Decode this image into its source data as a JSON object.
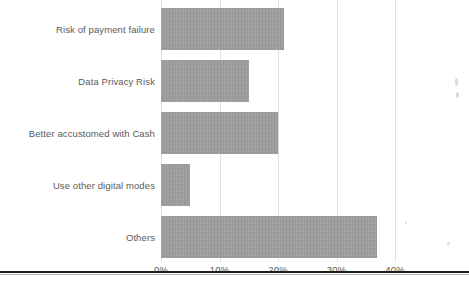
{
  "chart_data": {
    "type": "bar",
    "orientation": "horizontal",
    "title": "",
    "subtitle": "",
    "xlabel": "",
    "ylabel": "",
    "categories": [
      "Risk of payment failure",
      "Data Privacy Risk",
      "Better accustomed with Cash",
      "Use other digital modes",
      "Others"
    ],
    "values": [
      21,
      15,
      20,
      5,
      37
    ],
    "value_unit": "%",
    "series": [
      {
        "name": "Share of respondents",
        "values": [
          21,
          15,
          20,
          5,
          37
        ],
        "color": "#9a9a9a"
      }
    ],
    "xlim": [
      0,
      40
    ],
    "xticks": [
      0,
      10,
      20,
      30,
      40
    ],
    "xtick_labels": [
      "0%",
      "10%",
      "20%",
      "30%",
      "40%"
    ],
    "grid": true,
    "grid_axis": "x",
    "legend": false,
    "legend_position": "none",
    "annotations": []
  },
  "style": {
    "bar_color": "#9a9a9a",
    "grid_color": "#e2e2e2",
    "text_color": "#5a5a5a",
    "background": "#ffffff",
    "rule_color": "#1d1d1d"
  }
}
